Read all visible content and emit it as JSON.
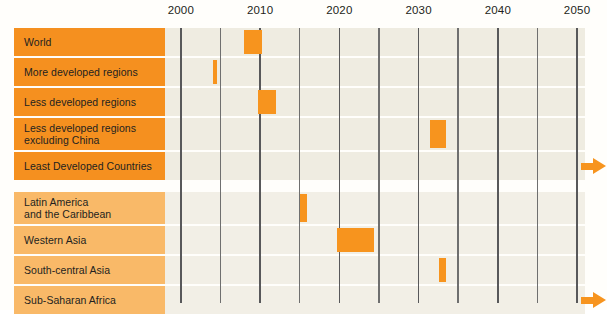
{
  "chart_data": {
    "type": "bar",
    "title": "",
    "subtitle": "",
    "xlabel": "",
    "ylabel": "",
    "xlim": [
      1998,
      2051
    ],
    "grid": true,
    "grid_interval_years": 5,
    "legend": "none",
    "orientation": "horizontal-range",
    "axis": {
      "tick_labels": [
        "2000",
        "2010",
        "2020",
        "2030",
        "2040",
        "2050"
      ],
      "tick_values": [
        2000,
        2010,
        2020,
        2030,
        2040,
        2050
      ],
      "minor_tick_values": [
        2005,
        2015,
        2025,
        2035,
        2045
      ]
    },
    "groups": [
      {
        "name": "group-a",
        "color": "#F5901F",
        "categories": [
          {
            "label": "World",
            "label_lines": [
              "World"
            ],
            "start": 2008,
            "end": 2010.2,
            "open_ended": false
          },
          {
            "label": "More developed regions",
            "label_lines": [
              "More developed regions"
            ],
            "start": 2004.0,
            "end": 2004.6,
            "open_ended": false
          },
          {
            "label": "Less developed regions",
            "label_lines": [
              "Less developed regions"
            ],
            "start": 2009.7,
            "end": 2012.0,
            "open_ended": false
          },
          {
            "label": "Less developed regions excluding China",
            "label_lines": [
              "Less developed regions",
              "excluding China"
            ],
            "start": 2031.5,
            "end": 2033.5,
            "open_ended": false
          },
          {
            "label": "Least Developed Countries",
            "label_lines": [
              "Least Developed Countries"
            ],
            "start": null,
            "end": null,
            "open_ended": true
          }
        ]
      },
      {
        "name": "group-b",
        "color": "#F9B968",
        "categories": [
          {
            "label": "Latin America and the Caribbean",
            "label_lines": [
              "Latin America",
              "and the Caribbean"
            ],
            "start": 2015.0,
            "end": 2015.9,
            "open_ended": false
          },
          {
            "label": "Western Asia",
            "label_lines": [
              "Western Asia"
            ],
            "start": 2019.7,
            "end": 2024.4,
            "open_ended": false
          },
          {
            "label": "South-central Asia",
            "label_lines": [
              "South-central Asia"
            ],
            "start": 2032.6,
            "end": 2033.5,
            "open_ended": false
          },
          {
            "label": "Sub-Saharan Africa",
            "label_lines": [
              "Sub-Saharan Africa"
            ],
            "start": null,
            "end": null,
            "open_ended": true
          }
        ]
      }
    ],
    "open_ended_marker": "right-arrow",
    "colors": {
      "bar": "#F7941E",
      "label_group_a": "#F5901F",
      "label_group_b": "#F9B968",
      "plot_band": "#efece1",
      "gridline": "#58585a",
      "background": "#fffefb",
      "text": "#231f20"
    }
  }
}
